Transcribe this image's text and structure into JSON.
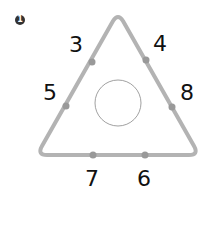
{
  "problem": {
    "number_badge": "1"
  },
  "diagram": {
    "edge_color": "#b3b3b3",
    "dot_color": "#999999",
    "circle_color": "#888888",
    "circle_value": "",
    "labels": {
      "left_top": "3",
      "right_top": "4",
      "left_mid": "5",
      "right_mid": "8",
      "bottom_left": "7",
      "bottom_right": "6"
    }
  }
}
